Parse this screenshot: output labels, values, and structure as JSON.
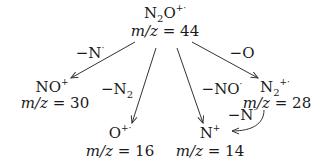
{
  "diagram": {
    "nodes": {
      "parent": {
        "formula_main": "N",
        "formula_sub": "2",
        "formula_tail": "O",
        "charge": "+·",
        "mz_prefix": "m/z = ",
        "mz_value": "44"
      },
      "no": {
        "formula_main": "NO",
        "charge": "+",
        "mz_prefix": "m/z = ",
        "mz_value": "30"
      },
      "o": {
        "formula_main": "O",
        "charge": "+·",
        "mz_prefix": "m/z = ",
        "mz_value": "16"
      },
      "n": {
        "formula_main": "N",
        "charge": "+",
        "mz_prefix": "m/z = ",
        "mz_value": "14"
      },
      "n2": {
        "formula_main": "N",
        "formula_sub": "2",
        "charge": "+·",
        "mz_prefix": "m/z = ",
        "mz_value": "28"
      }
    },
    "losses": {
      "to_no": {
        "main": "−N",
        "sup": "·"
      },
      "to_o": {
        "main": "−N",
        "sub": "2"
      },
      "to_n": {
        "main": "−NO",
        "sup": "·"
      },
      "to_n2": {
        "main": "−O"
      },
      "n2_to_n": {
        "main": "−N",
        "sup": "·"
      }
    },
    "colors": {
      "text": "#1a1a1a",
      "arrow": "#333333",
      "background": "#ffffff"
    }
  }
}
